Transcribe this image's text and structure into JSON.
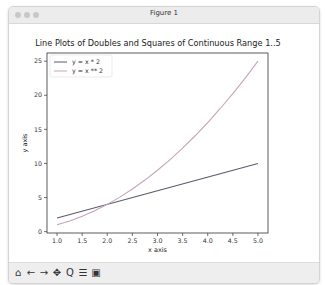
{
  "window": {
    "title": "Figure 1"
  },
  "toolbar": {
    "buttons": [
      {
        "name": "home-button",
        "icon": "home-icon",
        "glyph": "⌂"
      },
      {
        "name": "back-button",
        "icon": "arrow-left-icon",
        "glyph": "←"
      },
      {
        "name": "forward-button",
        "icon": "arrow-right-icon",
        "glyph": "→"
      },
      {
        "name": "pan-button",
        "icon": "move-icon",
        "glyph": "✥"
      },
      {
        "name": "zoom-button",
        "icon": "magnifier-icon",
        "glyph": "Q"
      },
      {
        "name": "configure-button",
        "icon": "sliders-icon",
        "glyph": "☰"
      },
      {
        "name": "save-button",
        "icon": "floppy-disk-icon",
        "glyph": "▣"
      }
    ]
  },
  "colors": {
    "series1": "#5c5a6e",
    "series2": "#c7a3b8",
    "axis": "#333333"
  },
  "chart_data": {
    "type": "line",
    "title": "Line Plots of Doubles and Squares of Continuous Range 1..5",
    "xlabel": "x axis",
    "ylabel": "y axis",
    "xlim": [
      0.8,
      5.2
    ],
    "ylim": [
      -0.2,
      26.2
    ],
    "xticks": [
      1.0,
      1.5,
      2.0,
      2.5,
      3.0,
      3.5,
      4.0,
      4.5,
      5.0
    ],
    "xtick_labels": [
      "1.0",
      "1.5",
      "2.0",
      "2.5",
      "3.0",
      "3.5",
      "4.0",
      "4.5",
      "5.0"
    ],
    "yticks": [
      0,
      5,
      10,
      15,
      20,
      25
    ],
    "ytick_labels": [
      "0",
      "5",
      "10",
      "15",
      "20",
      "25"
    ],
    "grid": false,
    "legend": "top-left",
    "series": [
      {
        "name": "y = x * 2",
        "x": [
          1.0,
          5.0
        ],
        "values": [
          2,
          10
        ]
      },
      {
        "name": "y = x ** 2",
        "x": [
          1.0,
          1.25,
          1.5,
          1.75,
          2.0,
          2.25,
          2.5,
          2.75,
          3.0,
          3.25,
          3.5,
          3.75,
          4.0,
          4.25,
          4.5,
          4.75,
          5.0
        ],
        "values": [
          1.0,
          1.5625,
          2.25,
          3.0625,
          4.0,
          5.0625,
          6.25,
          7.5625,
          9.0,
          10.5625,
          12.25,
          14.0625,
          16.0,
          18.0625,
          20.25,
          22.5625,
          25.0
        ]
      }
    ]
  }
}
